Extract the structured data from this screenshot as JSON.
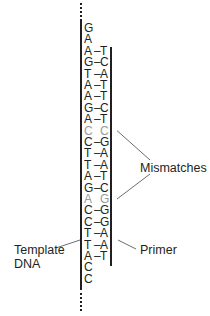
{
  "diagram": {
    "colors": {
      "text": "#231f20",
      "mismatch": "#9a9a9a",
      "line": "#231f20",
      "pointer": "#6d6e71"
    },
    "template_strand": [
      "G",
      "A",
      "A",
      "G",
      "T",
      "A",
      "A",
      "G",
      "A",
      "C",
      "C",
      "T",
      "T",
      "A",
      "G",
      "A",
      "C",
      "C",
      "T",
      "T",
      "A",
      "C",
      "C"
    ],
    "primer_strand": [
      "",
      "",
      "T",
      "C",
      "A",
      "T",
      "T",
      "C",
      "T",
      "C",
      "G",
      "A",
      "A",
      "T",
      "C",
      "G",
      "G",
      "G",
      "A",
      "A",
      "T",
      "",
      ""
    ],
    "mismatch_rows": [
      9,
      15
    ],
    "labels": {
      "mismatches": "Mismatches",
      "template_line1": "Template",
      "template_line2": "DNA",
      "primer": "Primer"
    }
  }
}
